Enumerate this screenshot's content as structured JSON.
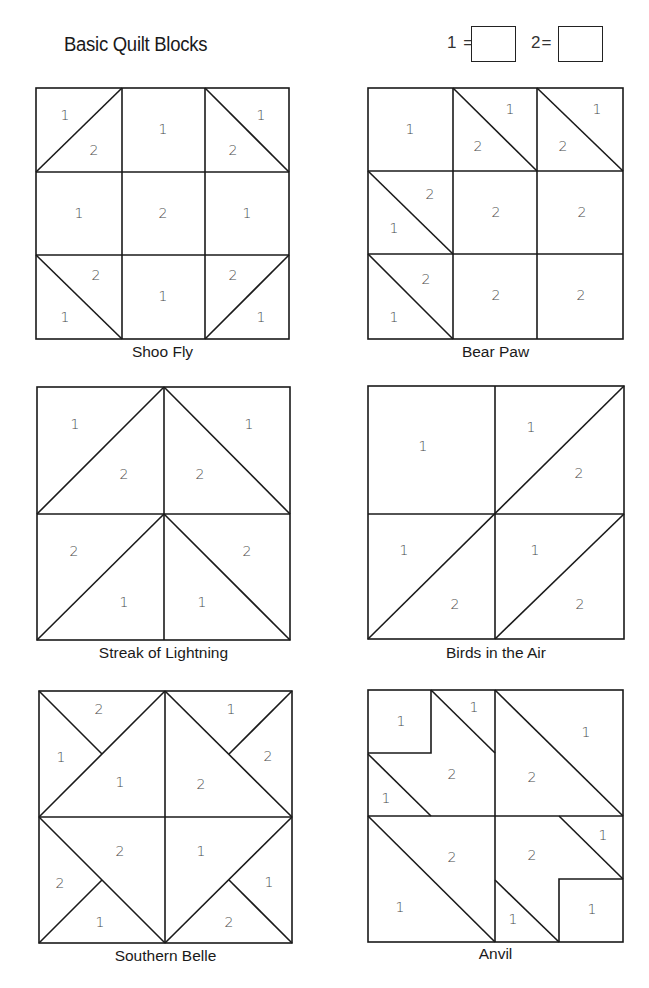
{
  "header": {
    "title": "Basic Quilt Blocks",
    "legend": [
      {
        "label": "1 =",
        "value": ""
      },
      {
        "label": "2=",
        "value": ""
      }
    ]
  },
  "blocks": [
    {
      "name": "Shoo Fly",
      "labels": [
        "1",
        "2",
        "1",
        "1",
        "2",
        "1",
        "2",
        "1",
        "2",
        "1",
        "1",
        "2",
        "1"
      ]
    },
    {
      "name": "Bear Paw",
      "labels": [
        "1",
        "1",
        "2",
        "1",
        "2",
        "2",
        "1",
        "2",
        "2",
        "2",
        "1",
        "2",
        "2"
      ]
    },
    {
      "name": "Streak of Lightning",
      "labels": [
        "1",
        "2",
        "2",
        "1",
        "2",
        "1",
        "1",
        "2"
      ]
    },
    {
      "name": "Birds in the Air",
      "labels": [
        "1",
        "1",
        "2",
        "1",
        "2",
        "1",
        "2"
      ]
    },
    {
      "name": "Southern Belle",
      "labels": [
        "2",
        "1",
        "1",
        "1",
        "2",
        "2",
        "2",
        "2",
        "1",
        "1",
        "1",
        "2"
      ]
    },
    {
      "name": "Anvil",
      "labels": [
        "1",
        "1",
        "2",
        "1",
        "2",
        "1",
        "2",
        "1",
        "2",
        "1",
        "1",
        "1"
      ]
    }
  ]
}
